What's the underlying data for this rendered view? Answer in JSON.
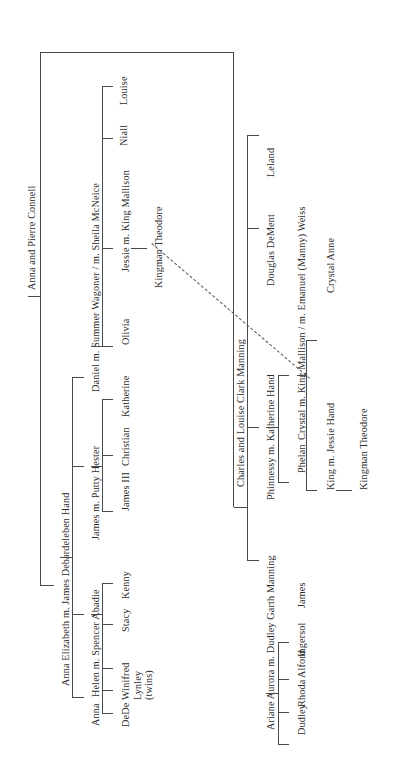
{
  "diagram": {
    "title": "Anna and Pierre Connell",
    "type": "family-tree",
    "orientation": "rotated-90-ccw",
    "root": "Anna and Pierre Connell",
    "note_link": "dashed line connecting the two Kingman Theodore entries"
  },
  "labels": {
    "root": "Anna and Pierre Connell",
    "gen2_a": "Anna Elizabeth m. James Debardeleben Hand",
    "gen2_b": "Charles and Louise Clark Manning",
    "anna": "Anna",
    "helen": "Helen m. Spencer Abadie",
    "james": "James m. Putty Hester",
    "daniel": "Daniel m. Summer Wagoner / m. Sheila McNeice",
    "dede": "DeDe",
    "winifred": "Winifred",
    "lynley": "Lynley",
    "twins": "(twins)",
    "stacy": "Stacy",
    "kenny": "Kenny",
    "james3": "James III",
    "christian": "Christian",
    "katherine": "Katherine",
    "olivia": "Olivia",
    "jessie": "Jessie m. King Mallison",
    "niall": "Niall",
    "louise": "Louise",
    "kingman_left": "Kingman Theodore",
    "phinnessy": "Phinnessy m. Katherine Hand",
    "ariane": "Ariane Aurora m. Dudley Garth Manning",
    "douglas": "Douglas DeMent",
    "leland": "Leland",
    "phelan": "Phelan",
    "crystal": "Crystal m. King Mallison / m. Emanuel (Manny) Weiss",
    "crystal_anne": "Crystal Anne",
    "king": "King m. Jessie Hand",
    "kingman_right": "Kingman Theodore",
    "dudley": "Dudley",
    "rhoda": "Rhoda",
    "alford": "Alford",
    "ingersol": "Ingersol",
    "james_m": "James"
  },
  "colors": {
    "line": "#4a4a4a",
    "text": "#2b2b2b",
    "background": "#ffffff",
    "dashed_link": "#555555"
  }
}
